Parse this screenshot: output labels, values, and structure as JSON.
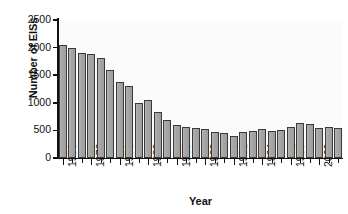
{
  "chart_data": {
    "type": "bar",
    "title": "",
    "subtitle": "",
    "xlabel": "Year",
    "ylabel": "Number of EISs",
    "categories": [
      "1973",
      "1974",
      "1975",
      "1976",
      "1977",
      "1978",
      "1979",
      "1980",
      "1981",
      "1982",
      "1983",
      "1984",
      "1985",
      "1986",
      "1987",
      "1988",
      "1989",
      "1990",
      "1991",
      "1992",
      "1993",
      "1994",
      "1995",
      "1996",
      "1997",
      "1998",
      "1999",
      "2000",
      "2001",
      "2002"
    ],
    "values": [
      2050,
      1985,
      1900,
      1890,
      1820,
      1590,
      1380,
      1300,
      990,
      1050,
      830,
      680,
      600,
      570,
      545,
      530,
      470,
      455,
      390,
      480,
      485,
      520,
      495,
      505,
      570,
      630,
      620,
      540,
      560,
      545
    ],
    "ylim": [
      0,
      2500
    ],
    "yticks": [
      0,
      500,
      1000,
      1500,
      2000,
      2500
    ],
    "ytick_labels": [
      "0",
      "500",
      "1000",
      "1500",
      "2000",
      "2500"
    ],
    "xtick_labels": [
      "1973",
      "1976",
      "1979",
      "1982",
      "1985",
      "1988",
      "1991",
      "1994",
      "1997",
      "2000"
    ],
    "xtick_categories": [
      "1973",
      "1976",
      "1979",
      "1982",
      "1985",
      "1988",
      "1991",
      "1994",
      "1997",
      "2000"
    ],
    "grid": false,
    "legend": null,
    "bar_color": "#a8a8a8",
    "bar_edge_color": "#3a3a3a",
    "axis_color": "#111111",
    "plot_background": "#fbfbfb",
    "figure_background": "#ffffff"
  }
}
